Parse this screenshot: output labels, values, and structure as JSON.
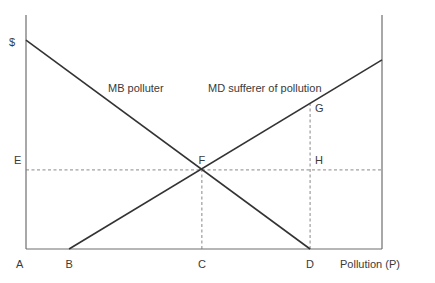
{
  "chart_data": {
    "type": "line",
    "title": "",
    "xlabel": "Pollution (P)",
    "ylabel": "$",
    "xlim": [
      0,
      100
    ],
    "ylim": [
      0,
      100
    ],
    "grid": false,
    "series": [
      {
        "name": "MB polluter",
        "label": "MB polluter",
        "points": [
          [
            0,
            89.3
          ],
          [
            79.8,
            0
          ]
        ]
      },
      {
        "name": "MD sufferer of pollution",
        "label": "MD sufferer of pollution",
        "points": [
          [
            12.1,
            0
          ],
          [
            100,
            80.8
          ]
        ]
      }
    ],
    "guides": [
      {
        "name": "E-F-H horizontal",
        "from": [
          0,
          33.8
        ],
        "to": [
          100,
          33.8
        ]
      },
      {
        "name": "C-F vertical",
        "from": [
          49.4,
          0
        ],
        "to": [
          49.4,
          33.8
        ]
      },
      {
        "name": "D-G vertical",
        "from": [
          79.8,
          0
        ],
        "to": [
          79.8,
          62.0
        ]
      }
    ],
    "points": [
      {
        "label": "A",
        "x": 0,
        "y": 0,
        "position": "below-left"
      },
      {
        "label": "B",
        "x": 12.1,
        "y": 0,
        "position": "below"
      },
      {
        "label": "C",
        "x": 49.4,
        "y": 0,
        "position": "below"
      },
      {
        "label": "D",
        "x": 79.8,
        "y": 0,
        "position": "below"
      },
      {
        "label": "E",
        "x": 0,
        "y": 33.8,
        "position": "left"
      },
      {
        "label": "F",
        "x": 49.4,
        "y": 33.8,
        "position": "above"
      },
      {
        "label": "G",
        "x": 79.8,
        "y": 62.0,
        "position": "right"
      },
      {
        "label": "H",
        "x": 79.8,
        "y": 33.8,
        "position": "above-right"
      }
    ],
    "axis_labels": {
      "y": "$",
      "x": "Pollution (P)"
    },
    "right_boundary_line": true
  },
  "colors": {
    "curve": "#333333",
    "axis": "#6e6e6e",
    "guide": "#7a7a7a",
    "text": "#3a3a3a"
  }
}
